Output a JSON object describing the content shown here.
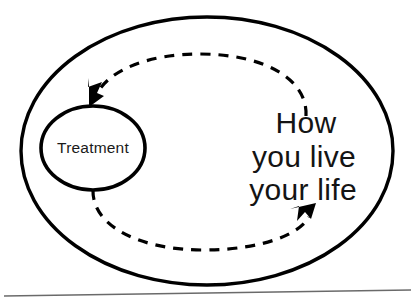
{
  "figure": {
    "background_color": "#ffffff",
    "stroke_color": "#000000",
    "text_color": "#141414",
    "baseline_rule_color": "#6a6a6a"
  },
  "outer_ellipse": {
    "label": "",
    "name": "outer-boundary-ellipse"
  },
  "inner_ellipse": {
    "label": "Treatment"
  },
  "life_text": {
    "line1": "How",
    "line2": "you live",
    "line3": "your life"
  },
  "cycle": {
    "arrow_to_treatment": "arrow-head-into-treatment",
    "arrow_to_life": "arrow-head-into-life",
    "dash_style": "dashed"
  }
}
